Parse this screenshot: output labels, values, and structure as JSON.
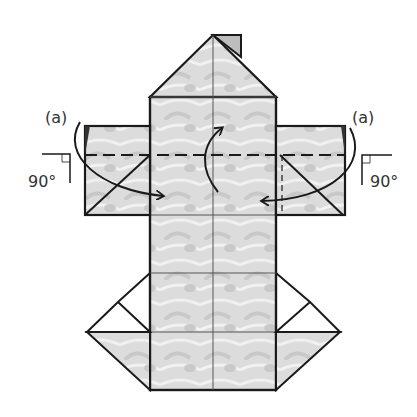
{
  "diagram": {
    "type": "origami-fold-step",
    "labels": {
      "left_step": "(a)",
      "right_step": "(a)",
      "left_angle": "90°",
      "right_angle": "90°"
    },
    "colors": {
      "outline": "#1a1a1a",
      "paper_fill": "#d9d9d9",
      "paper_light": "#ececec",
      "white_flap": "#ffffff",
      "arrow": "#1a1a1a"
    }
  }
}
